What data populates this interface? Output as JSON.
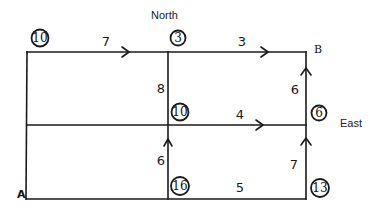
{
  "diagram": {
    "type": "shortest-path street grid",
    "labels": {
      "north": "North",
      "east": "East",
      "start": "A",
      "end": "B"
    },
    "nodes": [
      {
        "id": "top-left",
        "value": "10",
        "x": 27,
        "y": 52,
        "label_x": 40,
        "label_y": 38
      },
      {
        "id": "top-middle",
        "value": "3",
        "x": 168,
        "y": 52,
        "label_x": 178,
        "label_y": 38
      },
      {
        "id": "middle-center",
        "value": "10",
        "x": 168,
        "y": 125,
        "label_x": 180,
        "label_y": 112
      },
      {
        "id": "middle-right",
        "value": "6",
        "x": 306,
        "y": 125,
        "label_x": 319,
        "label_y": 113
      },
      {
        "id": "bottom-center",
        "value": "16",
        "x": 168,
        "y": 199,
        "label_x": 180,
        "label_y": 186
      },
      {
        "id": "bottom-right",
        "value": "13",
        "x": 306,
        "y": 199,
        "label_x": 320,
        "label_y": 188
      }
    ],
    "edges": [
      {
        "id": "top-left-to-top-middle",
        "weight": "7",
        "direction": "east",
        "arrow": true
      },
      {
        "id": "top-middle-to-B",
        "weight": "3",
        "direction": "east",
        "arrow": true
      },
      {
        "id": "top-middle-to-middle-center",
        "weight": "8",
        "direction": "vertical",
        "arrow": false
      },
      {
        "id": "middle-center-to-middle-right",
        "weight": "4",
        "direction": "east",
        "arrow": true
      },
      {
        "id": "middle-right-to-B",
        "weight": "6",
        "direction": "north",
        "arrow": true
      },
      {
        "id": "bottom-center-to-middle-center",
        "weight": "6",
        "direction": "north",
        "arrow": true
      },
      {
        "id": "A-to-bottom-center-to-bottom-right",
        "weight": "5",
        "direction": "east",
        "arrow": false
      },
      {
        "id": "bottom-right-to-middle-right",
        "weight": "7",
        "direction": "north",
        "arrow": true
      },
      {
        "id": "A-to-top-left",
        "weight": "",
        "direction": "vertical",
        "arrow": false
      },
      {
        "id": "left-middle-horizontal",
        "weight": "",
        "direction": "horizontal",
        "arrow": false
      }
    ]
  }
}
